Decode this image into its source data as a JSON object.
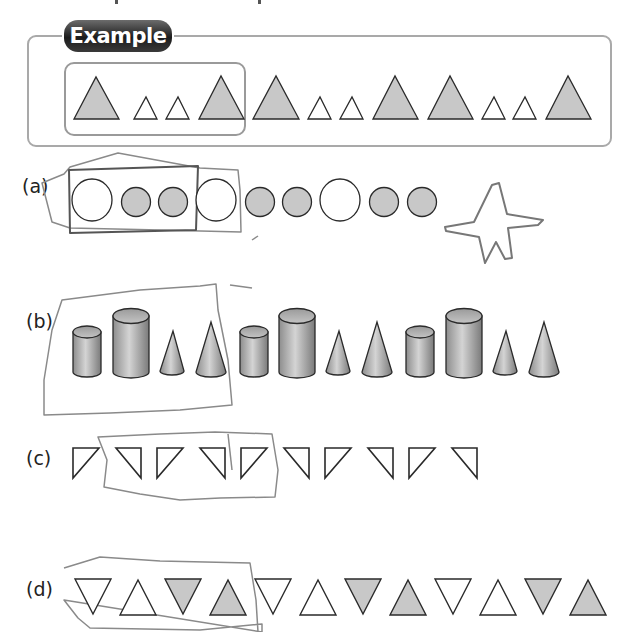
{
  "example": {
    "badge_label": "Example",
    "pattern_unit": [
      "big-gray-triangle",
      "small-white-triangle",
      "small-white-triangle",
      "big-gray-triangle"
    ],
    "sequence": [
      "big-gray-triangle",
      "small-white-triangle",
      "small-white-triangle",
      "big-gray-triangle",
      "big-gray-triangle",
      "small-white-triangle",
      "small-white-triangle",
      "big-gray-triangle",
      "big-gray-triangle",
      "small-white-triangle",
      "small-white-triangle",
      "big-gray-triangle"
    ]
  },
  "rows": [
    {
      "id": "a",
      "label": "(a)",
      "sequence": [
        "big-white-circle",
        "gray-circle",
        "gray-circle",
        "big-white-circle",
        "gray-circle",
        "gray-circle",
        "big-white-circle",
        "gray-circle",
        "gray-circle"
      ],
      "annotation": "hand-drawn box around first 3 shapes; hand-drawn star"
    },
    {
      "id": "b",
      "label": "(b)",
      "sequence": [
        "short-cylinder",
        "tall-cylinder",
        "small-cone",
        "large-cone",
        "short-cylinder",
        "tall-cylinder",
        "small-cone",
        "large-cone",
        "short-cylinder",
        "tall-cylinder",
        "small-cone",
        "large-cone"
      ],
      "annotation": "hand-drawn box around first 4 shapes"
    },
    {
      "id": "c",
      "label": "(c)",
      "sequence": [
        "right-angle-left",
        "right-angle-right",
        "right-angle-left",
        "right-angle-right",
        "right-angle-left",
        "right-angle-right",
        "right-angle-left",
        "right-angle-right",
        "right-angle-left",
        "right-angle-right"
      ],
      "annotation": "hand-drawn box around shapes 2-5"
    },
    {
      "id": "d",
      "label": "(d)",
      "sequence": [
        "white-down",
        "white-up",
        "gray-down",
        "gray-up",
        "white-down",
        "white-up",
        "gray-down",
        "gray-up",
        "white-down",
        "white-up",
        "gray-down",
        "gray-up"
      ],
      "annotation": "hand-drawn box around first 4 shapes"
    }
  ],
  "colors": {
    "shape_fill_gray": "#c8c8c8",
    "shape_stroke": "#2a2a2a",
    "frame_border": "#a9a9a9",
    "pencil": "#8a8a8a"
  }
}
